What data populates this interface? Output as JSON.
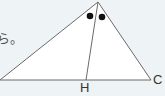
{
  "text_fragment": "ら。",
  "labels": {
    "H": "H",
    "C": "C"
  },
  "angle_marks": [
    "●",
    "●"
  ],
  "colors": {
    "background": "#eef3f6",
    "triangle_fill": "#ffffff",
    "stroke": "#6a6a6a",
    "dot": "#111111"
  }
}
